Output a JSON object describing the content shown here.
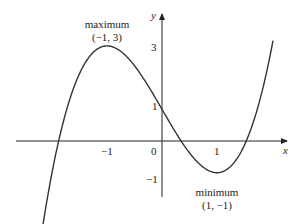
{
  "chart_data": {
    "type": "line",
    "title": "",
    "function": "y = x^3 - 3x + 1",
    "xlabel": "x",
    "ylabel": "y",
    "x_ticks": [
      "-1",
      "0",
      "1"
    ],
    "y_ticks": [
      "3",
      "1",
      "-1"
    ],
    "xlim": [
      -2.65,
      2.0
    ],
    "ylim": [
      -1.8,
      3.9
    ],
    "grid": false,
    "legend": null,
    "series": [
      {
        "name": "curve",
        "x": [
          -2.5,
          -2.0,
          -1.5,
          -1.0,
          -0.5,
          0.0,
          0.5,
          1.0,
          1.5,
          2.0
        ],
        "y": [
          -7.125,
          -1.0,
          2.125,
          3.0,
          2.375,
          1.0,
          -0.375,
          -1.0,
          -0.125,
          3.0
        ]
      }
    ],
    "annotations": [
      {
        "label": "maximum",
        "coords": "(−1, 3)",
        "x": -1,
        "y": 3
      },
      {
        "label": "minimum",
        "coords": "(1, −1)",
        "x": 1,
        "y": -1
      }
    ]
  },
  "labels": {
    "x_axis": "x",
    "y_axis": "y",
    "origin": "0",
    "x_tick_neg1": "−1",
    "x_tick_1": "1",
    "y_tick_3": "3",
    "y_tick_1": "1",
    "y_tick_neg1": "−1",
    "max_title": "maximum",
    "max_coords": "(−1, 3)",
    "min_title": "minimum",
    "min_coords": "(1, −1)"
  }
}
